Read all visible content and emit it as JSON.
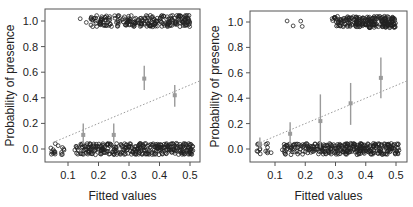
{
  "chart_data": [
    {
      "type": "scatter",
      "panel": "left",
      "title": "",
      "xlabel": "Fitted values",
      "ylabel": "Probability of presence",
      "xlim": [
        0.03,
        0.54
      ],
      "ylim": [
        -0.09,
        1.09
      ],
      "xticks": [
        0.1,
        0.2,
        0.3,
        0.4,
        0.5
      ],
      "xtick_labels": [
        "0.1",
        "0.2",
        "0.3",
        "0.4",
        "0.5"
      ],
      "yticks": [
        0.0,
        0.2,
        0.4,
        0.6,
        0.8,
        1.0
      ],
      "ytick_labels": [
        "0.0",
        "0.2",
        "0.4",
        "0.6",
        "0.8",
        "1.0"
      ],
      "grid": false,
      "series": [
        {
          "name": "observed (jittered 0/1)",
          "kind": "open-circles",
          "color": "#222222",
          "absent_x_range": [
            0.04,
            0.51
          ],
          "present_x_range": [
            0.14,
            0.5
          ],
          "present_isolated_x": [
            0.14,
            0.16,
            0.185,
            0.19
          ]
        },
        {
          "name": "binned mean ± CI",
          "kind": "errorbar",
          "color": "#9a9a9a",
          "x": [
            0.15,
            0.25,
            0.35,
            0.45
          ],
          "y": [
            0.11,
            0.11,
            0.55,
            0.42
          ],
          "lower": [
            0.04,
            0.05,
            0.46,
            0.33
          ],
          "upper": [
            0.2,
            0.2,
            0.65,
            0.5
          ]
        },
        {
          "name": "1:1 line",
          "kind": "dotted-line",
          "color": "#9a9a9a",
          "x": [
            0.05,
            0.54
          ],
          "y": [
            0.05,
            0.54
          ]
        }
      ]
    },
    {
      "type": "scatter",
      "panel": "right",
      "title": "",
      "xlabel": "Fitted values",
      "ylabel": "Probability of presence",
      "xlim": [
        0.03,
        0.54
      ],
      "ylim": [
        -0.09,
        1.09
      ],
      "xticks": [
        0.1,
        0.2,
        0.3,
        0.4,
        0.5
      ],
      "xtick_labels": [
        "0.1",
        "0.2",
        "0.3",
        "0.4",
        "0.5"
      ],
      "yticks": [
        0.0,
        0.2,
        0.4,
        0.6,
        0.8,
        1.0
      ],
      "ytick_labels": [
        "0.0",
        "0.2",
        "0.4",
        "0.6",
        "0.8",
        "1.0"
      ],
      "grid": false,
      "series": [
        {
          "name": "observed (jittered 0/1)",
          "kind": "open-circles",
          "color": "#222222",
          "absent_x_range": [
            0.04,
            0.51
          ],
          "present_x_range": [
            0.27,
            0.5
          ],
          "present_isolated_x": [
            0.14,
            0.16,
            0.185,
            0.19
          ]
        },
        {
          "name": "binned mean ± CI",
          "kind": "errorbar",
          "color": "#9a9a9a",
          "x": [
            0.05,
            0.15,
            0.25,
            0.35,
            0.45
          ],
          "y": [
            0.04,
            0.12,
            0.22,
            0.36,
            0.56
          ],
          "lower": [
            0.0,
            0.03,
            0.01,
            0.19,
            0.4
          ],
          "upper": [
            0.09,
            0.21,
            0.43,
            0.52,
            0.72
          ]
        },
        {
          "name": "1:1 line",
          "kind": "dotted-line",
          "color": "#9a9a9a",
          "x": [
            0.04,
            0.54
          ],
          "y": [
            0.04,
            0.54
          ]
        }
      ]
    }
  ],
  "panels": {
    "left": {
      "xlabel": "Fitted values",
      "ylabel": "Probability of presence"
    },
    "right": {
      "xlabel": "Fitted values",
      "ylabel": "Probability of presence"
    }
  }
}
